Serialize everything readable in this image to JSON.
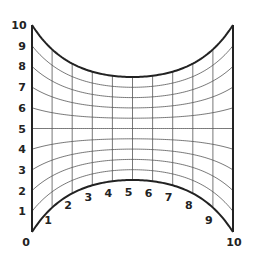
{
  "diagram": {
    "type": "curvilinear-grid",
    "colors": {
      "boundary": "#222222",
      "grid": "#555555",
      "label": "#222222",
      "background": "#ffffff"
    },
    "left_axis_labels": [
      "0",
      "1",
      "2",
      "3",
      "4",
      "5",
      "6",
      "7",
      "8",
      "9",
      "10"
    ],
    "bottom_curve_labels": [
      "1",
      "2",
      "3",
      "4",
      "5",
      "6",
      "7",
      "8",
      "9"
    ],
    "corner_labels": {
      "bottom_left": "0",
      "bottom_right": "10"
    },
    "grid_divisions": {
      "columns": 10,
      "rows": 10
    }
  }
}
